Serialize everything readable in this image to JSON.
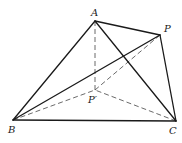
{
  "diagram": {
    "points": {
      "A": {
        "label": "A",
        "x": 95,
        "y": 21,
        "lx": 91,
        "ly": 16
      },
      "P": {
        "label": "P",
        "x": 160,
        "y": 35,
        "lx": 164,
        "ly": 32
      },
      "B": {
        "label": "B",
        "x": 13,
        "y": 120,
        "lx": 8,
        "ly": 133
      },
      "C": {
        "label": "C",
        "x": 176,
        "y": 121,
        "lx": 169,
        "ly": 134
      },
      "P1": {
        "label": "P′",
        "x": 95,
        "y": 90,
        "lx": 88,
        "ly": 103
      }
    },
    "solid_segments": [
      [
        "A",
        "B"
      ],
      [
        "A",
        "C"
      ],
      [
        "A",
        "P"
      ],
      [
        "P",
        "C"
      ],
      [
        "B",
        "C"
      ],
      [
        "B",
        "P"
      ]
    ],
    "dashed_segments": [
      [
        "A",
        "P1"
      ],
      [
        "B",
        "P1"
      ],
      [
        "C",
        "P1"
      ],
      [
        "P1",
        "P"
      ]
    ]
  }
}
